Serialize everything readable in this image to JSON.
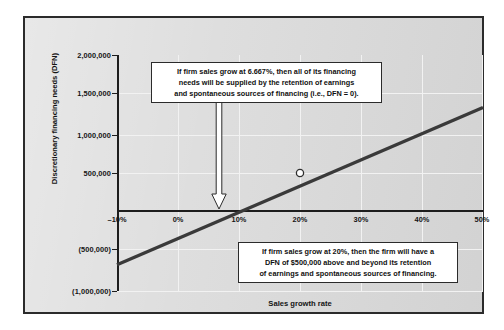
{
  "chart_data": {
    "type": "line",
    "title": "",
    "xlabel": "Sales growth rate",
    "ylabel": "Discretionary financing needs (DFN)",
    "xlim": [
      -10,
      50
    ],
    "ylim": [
      -1000000,
      2000000
    ],
    "grid": true,
    "legend": "none",
    "x_tick_labels": [
      "–10%",
      "0%",
      "10%",
      "20%",
      "30%",
      "40%",
      "50%"
    ],
    "x_tick_values": [
      -10,
      0,
      10,
      20,
      30,
      40,
      50
    ],
    "y_tick_labels": [
      "2,000,000",
      "1,500,000",
      "1,000,000",
      "500,000",
      "(500,000)",
      "(1,000,000)"
    ],
    "y_tick_values": [
      2000000,
      1500000,
      1000000,
      500000,
      -500000,
      -1000000
    ],
    "series": [
      {
        "name": "Discretionary financing needs",
        "x": [
          -10,
          50
        ],
        "values": [
          -666700,
          1333300
        ]
      }
    ],
    "markers": [
      {
        "name": "dfn-at-20-percent",
        "x": 20,
        "y": 500000,
        "label": ""
      }
    ],
    "x_intercept": 6.667,
    "annotations": [
      {
        "name": "breakeven-callout",
        "lines": [
          "If firm sales grow at 6.667%, then all of its financing",
          "needs will be supplied by the retention of earnings",
          "and spontaneous sources of financing (i.e., DFN = 0)."
        ]
      },
      {
        "name": "twenty-percent-callout",
        "lines": [
          "If firm sales grow at 20%, then the firm will have a",
          "DFN of $500,000 above and beyond its retention",
          "of earnings and spontaneous sources of financing."
        ]
      }
    ],
    "pointer": {
      "name": "breakeven-arrow",
      "direction": "down",
      "points_to_x": 6.667,
      "points_to_y": 0
    },
    "colors": {
      "line": "#3a3a3a",
      "frame_border": "#2b2b2b",
      "panel_background": "#dcdcdc",
      "gridline": "#f2f2f2",
      "axis": "#1d1d1d",
      "callout_background": "#ffffff",
      "text": "#101010"
    }
  }
}
